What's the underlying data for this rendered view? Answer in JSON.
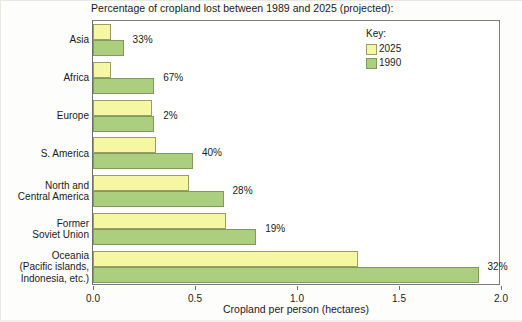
{
  "chart_data": {
    "type": "bar",
    "orientation": "horizontal",
    "title": "Percentage of cropland lost between 1989 and 2025 (projected):",
    "xlabel": "Cropland per person (hectares)",
    "ylabel": "",
    "xlim": [
      0.0,
      2.0
    ],
    "xticks": [
      "0.0",
      "0.5",
      "1.0",
      "1.5",
      "2.0"
    ],
    "xtick_values": [
      0.0,
      0.5,
      1.0,
      1.5,
      2.0
    ],
    "grid": false,
    "legend_position": "top-right",
    "legend_title": "Key:",
    "categories": [
      "Asia",
      "Africa",
      "Europe",
      "S. America",
      "North and Central America",
      "Former Soviet Union",
      "Oceania (Pacific islands, Indonesia, etc.)"
    ],
    "category_lines": [
      [
        "Asia"
      ],
      [
        "Africa"
      ],
      [
        "Europe"
      ],
      [
        "S. America"
      ],
      [
        "North and",
        "Central America"
      ],
      [
        "Former",
        "Soviet Union"
      ],
      [
        "Oceania",
        "(Pacific islands,",
        "Indonesia, etc.)"
      ]
    ],
    "series": [
      {
        "name": "2025",
        "color": "#F6F7A2",
        "values": [
          0.09,
          0.09,
          0.29,
          0.31,
          0.47,
          0.65,
          1.3
        ]
      },
      {
        "name": "1990",
        "color": "#ABCE7F",
        "values": [
          0.15,
          0.3,
          0.3,
          0.49,
          0.64,
          0.8,
          1.89
        ]
      }
    ],
    "annotations": [
      {
        "category": "Asia",
        "text": "33%"
      },
      {
        "category": "Africa",
        "text": "67%"
      },
      {
        "category": "Europe",
        "text": "2%"
      },
      {
        "category": "S. America",
        "text": "40%"
      },
      {
        "category": "North and Central America",
        "text": "28%"
      },
      {
        "category": "Former Soviet Union",
        "text": "19%"
      },
      {
        "category": "Oceania (Pacific islands, Indonesia, etc.)",
        "text": "32%"
      }
    ]
  },
  "legend": {
    "title": "Key:",
    "items": [
      {
        "label": "2025",
        "color": "#F6F7A2"
      },
      {
        "label": "1990",
        "color": "#ABCE7F"
      }
    ]
  }
}
